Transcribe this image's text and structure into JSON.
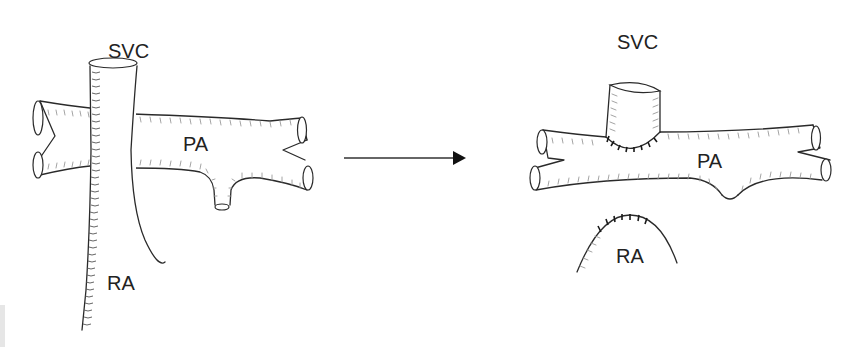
{
  "figure": {
    "before": {
      "labels": {
        "svc": "SVC",
        "pa": "PA",
        "ra": "RA"
      }
    },
    "after": {
      "labels": {
        "svc": "SVC",
        "pa": "PA",
        "ra": "RA"
      }
    },
    "arrow": {
      "direction": "right"
    },
    "colors": {
      "line": "#2a2a2a",
      "hatch": "#9a9a9a",
      "background": "#ffffff"
    }
  }
}
